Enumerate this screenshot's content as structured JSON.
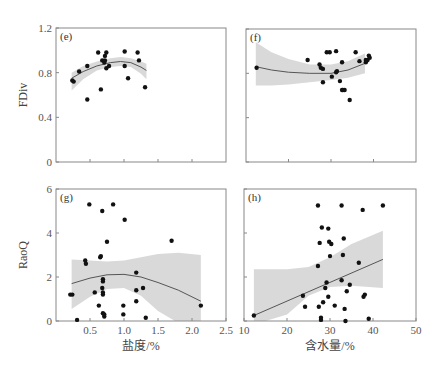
{
  "chart_data": [
    {
      "id": "e",
      "type": "scatter",
      "panel_label": "(e)",
      "ylabel": "FDiv",
      "xlabel": "",
      "xlim": [
        0,
        2.5
      ],
      "ylim": [
        0,
        1.2
      ],
      "xticks": [
        0.5,
        1.0,
        1.5,
        2.0
      ],
      "xtick_labels": [],
      "yticks": [
        0,
        0.4,
        0.8,
        1.2
      ],
      "ytick_labels": [
        "0",
        "0.4",
        "0.8",
        "1.2"
      ],
      "fit": "quadratic",
      "fit_curve": [
        [
          0.23,
          0.75
        ],
        [
          0.4,
          0.81
        ],
        [
          0.6,
          0.86
        ],
        [
          0.8,
          0.89
        ],
        [
          0.95,
          0.9
        ],
        [
          1.1,
          0.89
        ],
        [
          1.25,
          0.85
        ],
        [
          1.33,
          0.82
        ]
      ],
      "ci_upper": [
        [
          0.23,
          0.8
        ],
        [
          0.4,
          0.86
        ],
        [
          0.6,
          0.9
        ],
        [
          0.8,
          0.93
        ],
        [
          0.95,
          0.94
        ],
        [
          1.1,
          0.93
        ],
        [
          1.25,
          0.9
        ],
        [
          1.33,
          0.88
        ]
      ],
      "ci_lower": [
        [
          0.23,
          0.64
        ],
        [
          0.4,
          0.74
        ],
        [
          0.6,
          0.82
        ],
        [
          0.8,
          0.85
        ],
        [
          0.95,
          0.86
        ],
        [
          1.1,
          0.85
        ],
        [
          1.25,
          0.79
        ],
        [
          1.33,
          0.74
        ]
      ],
      "points": [
        [
          0.24,
          0.73
        ],
        [
          0.26,
          0.72
        ],
        [
          0.34,
          0.81
        ],
        [
          0.46,
          0.86
        ],
        [
          0.46,
          0.56
        ],
        [
          0.62,
          0.98
        ],
        [
          0.66,
          0.65
        ],
        [
          0.68,
          0.91
        ],
        [
          0.72,
          0.91
        ],
        [
          0.72,
          0.95
        ],
        [
          0.74,
          0.98
        ],
        [
          0.71,
          0.89
        ],
        [
          0.74,
          0.84
        ],
        [
          0.78,
          0.86
        ],
        [
          1.01,
          0.99
        ],
        [
          1.01,
          0.86
        ],
        [
          1.06,
          0.75
        ],
        [
          1.2,
          0.98
        ],
        [
          1.22,
          0.91
        ],
        [
          1.31,
          0.67
        ]
      ]
    },
    {
      "id": "f",
      "type": "scatter",
      "panel_label": "(f)",
      "ylabel": "",
      "xlabel": "",
      "xlim": [
        10,
        50
      ],
      "ylim": [
        0,
        1.2
      ],
      "xticks": [
        20,
        30,
        40
      ],
      "xtick_labels": [],
      "yticks": [
        0,
        0.4,
        0.8,
        1.2
      ],
      "ytick_labels": [],
      "fit": "quadratic",
      "fit_curve": [
        [
          12.3,
          0.86
        ],
        [
          16,
          0.83
        ],
        [
          20,
          0.81
        ],
        [
          25,
          0.8
        ],
        [
          30,
          0.8
        ],
        [
          34,
          0.83
        ],
        [
          38,
          0.89
        ]
      ],
      "ci_upper": [
        [
          12.3,
          1.08
        ],
        [
          16,
          0.99
        ],
        [
          20,
          0.93
        ],
        [
          25,
          0.88
        ],
        [
          30,
          0.88
        ],
        [
          34,
          0.91
        ],
        [
          38,
          0.98
        ]
      ],
      "ci_lower": [
        [
          12.3,
          0.69
        ],
        [
          16,
          0.69
        ],
        [
          20,
          0.7
        ],
        [
          25,
          0.72
        ],
        [
          30,
          0.74
        ],
        [
          34,
          0.76
        ],
        [
          38,
          0.8
        ]
      ],
      "points": [
        [
          12.5,
          0.85
        ],
        [
          24.5,
          0.92
        ],
        [
          27.3,
          0.88
        ],
        [
          27.6,
          0.85
        ],
        [
          28.1,
          0.84
        ],
        [
          29,
          0.99
        ],
        [
          29.7,
          0.99
        ],
        [
          28.1,
          0.72
        ],
        [
          30.2,
          0.77
        ],
        [
          31.2,
          1.0
        ],
        [
          31.2,
          0.81
        ],
        [
          31.4,
          0.82
        ],
        [
          32.1,
          0.73
        ],
        [
          32.6,
          0.65
        ],
        [
          32.6,
          0.9
        ],
        [
          32.8,
          0.65
        ],
        [
          33.2,
          0.65
        ],
        [
          34.4,
          0.56
        ],
        [
          35.8,
          0.99
        ],
        [
          36.7,
          0.91
        ],
        [
          38.2,
          0.9
        ],
        [
          38.2,
          0.92
        ],
        [
          38.6,
          0.92
        ],
        [
          38.9,
          0.96
        ],
        [
          39.1,
          0.94
        ]
      ]
    },
    {
      "id": "g",
      "type": "scatter",
      "panel_label": "(g)",
      "ylabel": "RaoQ",
      "xlabel": "盐度/%",
      "xlim": [
        0,
        2.5
      ],
      "ylim": [
        0,
        6
      ],
      "xticks": [
        0.5,
        1.0,
        1.5,
        2.0,
        2.5
      ],
      "xtick_labels": [
        "0.5",
        "1.0",
        "1.5",
        "2.0",
        "2.5"
      ],
      "yticks": [
        0,
        2,
        4,
        6
      ],
      "ytick_labels": [
        "0",
        "2",
        "4",
        "6"
      ],
      "fit": "quadratic",
      "fit_curve": [
        [
          0.23,
          1.7
        ],
        [
          0.5,
          1.95
        ],
        [
          0.75,
          2.1
        ],
        [
          1.0,
          2.12
        ],
        [
          1.25,
          2.0
        ],
        [
          1.5,
          1.75
        ],
        [
          1.8,
          1.4
        ],
        [
          2.13,
          0.9
        ]
      ],
      "ci_upper": [
        [
          0.23,
          2.8
        ],
        [
          0.5,
          2.75
        ],
        [
          0.75,
          2.7
        ],
        [
          1.0,
          2.75
        ],
        [
          1.25,
          2.9
        ],
        [
          1.5,
          3.05
        ],
        [
          1.8,
          3.1
        ],
        [
          2.13,
          3.0
        ]
      ],
      "ci_lower": [
        [
          0.23,
          0.55
        ],
        [
          0.5,
          1.1
        ],
        [
          0.75,
          1.45
        ],
        [
          1.0,
          1.5
        ],
        [
          1.25,
          1.15
        ],
        [
          1.5,
          0.45
        ],
        [
          1.75,
          0.0
        ],
        [
          2.13,
          0.0
        ]
      ],
      "points": [
        [
          0.21,
          1.2
        ],
        [
          0.24,
          1.2
        ],
        [
          0.31,
          0.05
        ],
        [
          0.43,
          2.75
        ],
        [
          0.44,
          2.6
        ],
        [
          0.49,
          5.3
        ],
        [
          0.57,
          1.3
        ],
        [
          0.63,
          0.7
        ],
        [
          0.65,
          2.9
        ],
        [
          0.66,
          2.95
        ],
        [
          0.68,
          5.0
        ],
        [
          0.69,
          1.2
        ],
        [
          0.69,
          0.35
        ],
        [
          0.69,
          1.3
        ],
        [
          0.69,
          1.9
        ],
        [
          0.68,
          1.5
        ],
        [
          0.69,
          1.8
        ],
        [
          0.71,
          0.2
        ],
        [
          0.71,
          0.3
        ],
        [
          0.75,
          3.6
        ],
        [
          0.84,
          5.3
        ],
        [
          1.01,
          4.6
        ],
        [
          0.99,
          0.7
        ],
        [
          0.99,
          0.3
        ],
        [
          1.18,
          2.2
        ],
        [
          1.18,
          1.4
        ],
        [
          1.18,
          0.9
        ],
        [
          1.28,
          1.5
        ],
        [
          1.32,
          0.15
        ],
        [
          1.7,
          3.65
        ],
        [
          2.13,
          0.7
        ]
      ]
    },
    {
      "id": "h",
      "type": "scatter",
      "panel_label": "(h)",
      "ylabel": "",
      "xlabel": "含水量/%",
      "xlim": [
        10,
        50
      ],
      "ylim": [
        0,
        6
      ],
      "xticks": [
        10,
        20,
        30,
        40,
        50
      ],
      "xtick_labels": [
        "10",
        "20",
        "30",
        "40",
        "50"
      ],
      "yticks": [
        0,
        2,
        4,
        6
      ],
      "ytick_labels": [],
      "fit": "linear",
      "fit_curve": [
        [
          12.3,
          0.25
        ],
        [
          42.3,
          2.8
        ]
      ],
      "ci_upper": [
        [
          12.3,
          2.35
        ],
        [
          20,
          2.35
        ],
        [
          25,
          2.45
        ],
        [
          30,
          2.9
        ],
        [
          35,
          3.5
        ],
        [
          42.3,
          4.1
        ]
      ],
      "ci_lower": [
        [
          12.3,
          0.0
        ],
        [
          15,
          0.0
        ],
        [
          20,
          0.3
        ],
        [
          25,
          1.15
        ],
        [
          30,
          1.55
        ],
        [
          35,
          1.6
        ],
        [
          42.3,
          1.5
        ]
      ],
      "points": [
        [
          12.3,
          0.25
        ],
        [
          23.7,
          1.15
        ],
        [
          24.2,
          0.65
        ],
        [
          27.2,
          5.25
        ],
        [
          27.2,
          2.5
        ],
        [
          27.4,
          0.65
        ],
        [
          27.9,
          0.15
        ],
        [
          27.9,
          0.05
        ],
        [
          27.6,
          3.55
        ],
        [
          28.1,
          4.25
        ],
        [
          28.4,
          0.85
        ],
        [
          28.9,
          1.5
        ],
        [
          29.2,
          1.75
        ],
        [
          29.6,
          4.2
        ],
        [
          29.6,
          1.1
        ],
        [
          29.8,
          3.6
        ],
        [
          30.0,
          2.95
        ],
        [
          30.3,
          3.5
        ],
        [
          31.1,
          0.7
        ],
        [
          32.7,
          5.25
        ],
        [
          32.7,
          1.85
        ],
        [
          33.0,
          3.0
        ],
        [
          33.2,
          3.75
        ],
        [
          33.4,
          0.55
        ],
        [
          33.6,
          0.0
        ],
        [
          33.9,
          1.35
        ],
        [
          34.6,
          1.65
        ],
        [
          36.7,
          2.65
        ],
        [
          37.6,
          5.05
        ],
        [
          37.8,
          1.1
        ],
        [
          38.1,
          1.2
        ],
        [
          39.0,
          0.1
        ],
        [
          42.3,
          5.25
        ]
      ]
    }
  ]
}
